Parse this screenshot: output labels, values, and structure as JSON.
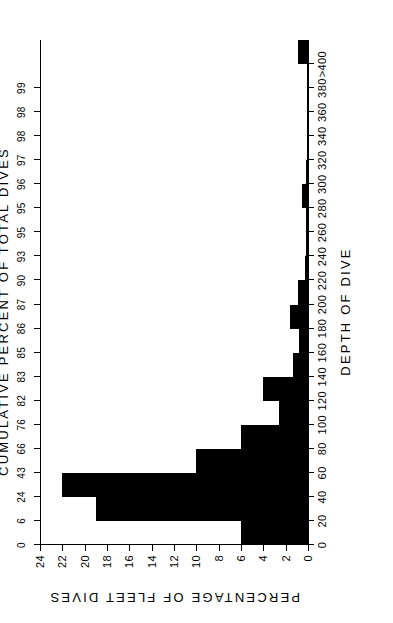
{
  "chart_data": {
    "type": "bar",
    "title": "",
    "xlabel": "DEPTH OF DIVE",
    "ylabel": "PERCENTAGE OF FLEET DIVES",
    "secondary_axis_label": "CUMULATIVE PERCENT OF TOTAL DIVES",
    "grid": false,
    "legend": "none",
    "xlim": [
      0,
      420
    ],
    "ylim": [
      0,
      24
    ],
    "xticks": [
      "0",
      "20",
      "40",
      "60",
      "80",
      "100",
      "120",
      "140",
      "160",
      "180",
      "200",
      "220",
      "240",
      "260",
      "280",
      "300",
      "320",
      "340",
      "360",
      "380",
      ">400"
    ],
    "xtick_values": [
      0,
      20,
      40,
      60,
      80,
      100,
      120,
      140,
      160,
      180,
      200,
      220,
      240,
      260,
      280,
      300,
      320,
      340,
      360,
      380,
      400
    ],
    "yticks": [
      "0",
      "2",
      "4",
      "6",
      "8",
      "10",
      "12",
      "14",
      "16",
      "18",
      "20",
      "22",
      "24"
    ],
    "ytick_values": [
      0,
      2,
      4,
      6,
      8,
      10,
      12,
      14,
      16,
      18,
      20,
      22,
      24
    ],
    "cumulative_ticks": [
      "0",
      "6",
      "24",
      "43",
      "66",
      "76",
      "82",
      "83",
      "85",
      "86",
      "87",
      "90",
      "93",
      "95",
      "95",
      "96",
      "97",
      "98",
      "98",
      "99"
    ],
    "cumulative_values": [
      0,
      6,
      24,
      43,
      66,
      76,
      82,
      83,
      85,
      86,
      87,
      90,
      93,
      95,
      95,
      96,
      97,
      98,
      98,
      99
    ],
    "categories": [
      "0-20",
      "20-40",
      "40-60",
      "60-80",
      "80-100",
      "100-120",
      "120-140",
      "140-160",
      "160-180",
      "180-200",
      "200-220",
      "220-240",
      "240-260",
      "260-280",
      "280-300",
      "300-320",
      "320-340",
      "340-360",
      "360-380",
      "380-400",
      ">400"
    ],
    "bin_starts": [
      0,
      20,
      40,
      60,
      80,
      100,
      120,
      140,
      160,
      180,
      200,
      220,
      240,
      260,
      280,
      300,
      320,
      340,
      360,
      380,
      400
    ],
    "bin_width": 20,
    "values": [
      6.0,
      19.0,
      22.0,
      10.0,
      6.0,
      2.6,
      4.0,
      1.3,
      0.8,
      1.6,
      0.9,
      0.3,
      0.2,
      0.2,
      0.5,
      0.2,
      0.1,
      0.1,
      0.1,
      0.1,
      0.9
    ]
  }
}
